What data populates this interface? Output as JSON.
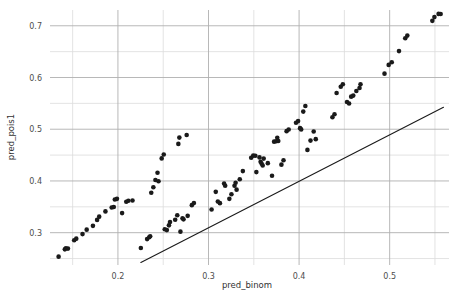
{
  "chart_data": {
    "type": "scatter",
    "title": "",
    "xlabel": "pred_binom",
    "ylabel": "pred_pois1",
    "xlim": [
      0.125,
      0.5655
    ],
    "ylim": [
      0.2375,
      0.7305
    ],
    "xticks": [
      0.2,
      0.3,
      0.4,
      0.5
    ],
    "xtick_labels": [
      "0.2",
      "0.3",
      "0.4",
      "0.5"
    ],
    "yticks": [
      0.3,
      0.4,
      0.5,
      0.6,
      0.7
    ],
    "ytick_labels": [
      "0.3",
      "0.4",
      "0.5",
      "0.6",
      "0.7"
    ],
    "x_minor_ticks": [
      0.15,
      0.25,
      0.35,
      0.45,
      0.55
    ],
    "y_minor_ticks": [
      0.25,
      0.35,
      0.45,
      0.55,
      0.65
    ],
    "grid": true,
    "grid_major_color": "#b0b0b0",
    "grid_minor_color": "#dcdcdc",
    "point_color": "#1a1a1a",
    "point_size": 2.3,
    "legend": null,
    "reference_line": {
      "label": "identity-reference-line",
      "color": "#1a1a1a",
      "width": 1.1,
      "x": [
        0.2253,
        0.5594
      ],
      "y": [
        0.2424,
        0.5423
      ]
    },
    "series": [
      {
        "name": "pred_pois1 vs pred_binom",
        "marker": "circle",
        "color": "#1a1a1a",
        "points": [
          [
            0.1345,
            0.2536
          ],
          [
            0.1414,
            0.2678
          ],
          [
            0.1425,
            0.27
          ],
          [
            0.1448,
            0.2692
          ],
          [
            0.1517,
            0.2853
          ],
          [
            0.154,
            0.2884
          ],
          [
            0.1609,
            0.2972
          ],
          [
            0.1655,
            0.3058
          ],
          [
            0.1724,
            0.3132
          ],
          [
            0.177,
            0.3247
          ],
          [
            0.1793,
            0.331
          ],
          [
            0.1862,
            0.3411
          ],
          [
            0.1931,
            0.3486
          ],
          [
            0.1954,
            0.3496
          ],
          [
            0.1966,
            0.3642
          ],
          [
            0.1989,
            0.3654
          ],
          [
            0.2046,
            0.3378
          ],
          [
            0.2092,
            0.3598
          ],
          [
            0.2115,
            0.3618
          ],
          [
            0.2161,
            0.3623
          ],
          [
            0.2253,
            0.2704
          ],
          [
            0.2322,
            0.2876
          ],
          [
            0.2345,
            0.2912
          ],
          [
            0.2356,
            0.293
          ],
          [
            0.2368,
            0.3772
          ],
          [
            0.2391,
            0.3877
          ],
          [
            0.2414,
            0.4017
          ],
          [
            0.2437,
            0.4158
          ],
          [
            0.2448,
            0.3993
          ],
          [
            0.2483,
            0.4436
          ],
          [
            0.2506,
            0.4511
          ],
          [
            0.2517,
            0.3066
          ],
          [
            0.254,
            0.305
          ],
          [
            0.2563,
            0.3142
          ],
          [
            0.2575,
            0.3205
          ],
          [
            0.2632,
            0.325
          ],
          [
            0.2655,
            0.3338
          ],
          [
            0.2667,
            0.4716
          ],
          [
            0.2678,
            0.4838
          ],
          [
            0.269,
            0.302
          ],
          [
            0.2713,
            0.328
          ],
          [
            0.2724,
            0.3258
          ],
          [
            0.2759,
            0.4887
          ],
          [
            0.277,
            0.3325
          ],
          [
            0.2816,
            0.3532
          ],
          [
            0.2839,
            0.3575
          ],
          [
            0.3034,
            0.3449
          ],
          [
            0.308,
            0.3789
          ],
          [
            0.3103,
            0.3602
          ],
          [
            0.3126,
            0.3571
          ],
          [
            0.3172,
            0.3952
          ],
          [
            0.3184,
            0.3906
          ],
          [
            0.323,
            0.3654
          ],
          [
            0.3253,
            0.3742
          ],
          [
            0.3287,
            0.3906
          ],
          [
            0.3299,
            0.3966
          ],
          [
            0.331,
            0.3832
          ],
          [
            0.3345,
            0.4033
          ],
          [
            0.3379,
            0.419
          ],
          [
            0.3471,
            0.4448
          ],
          [
            0.3494,
            0.449
          ],
          [
            0.3517,
            0.4486
          ],
          [
            0.3528,
            0.4171
          ],
          [
            0.3563,
            0.4455
          ],
          [
            0.3575,
            0.4371
          ],
          [
            0.3586,
            0.4335
          ],
          [
            0.3598,
            0.4298
          ],
          [
            0.3609,
            0.4432
          ],
          [
            0.3655,
            0.4344
          ],
          [
            0.3701,
            0.41
          ],
          [
            0.3724,
            0.476
          ],
          [
            0.3747,
            0.4768
          ],
          [
            0.3759,
            0.4836
          ],
          [
            0.377,
            0.4771
          ],
          [
            0.3805,
            0.4315
          ],
          [
            0.3828,
            0.44
          ],
          [
            0.3862,
            0.4963
          ],
          [
            0.3885,
            0.4995
          ],
          [
            0.3966,
            0.5126
          ],
          [
            0.3989,
            0.5157
          ],
          [
            0.4011,
            0.5021
          ],
          [
            0.4023,
            0.4997
          ],
          [
            0.4046,
            0.5341
          ],
          [
            0.4069,
            0.545
          ],
          [
            0.4092,
            0.46
          ],
          [
            0.4126,
            0.478
          ],
          [
            0.4161,
            0.4955
          ],
          [
            0.4184,
            0.4808
          ],
          [
            0.4368,
            0.5232
          ],
          [
            0.4391,
            0.529
          ],
          [
            0.4414,
            0.57
          ],
          [
            0.446,
            0.582
          ],
          [
            0.4483,
            0.587
          ],
          [
            0.4529,
            0.5525
          ],
          [
            0.4552,
            0.5496
          ],
          [
            0.4575,
            0.563
          ],
          [
            0.4598,
            0.565
          ],
          [
            0.4632,
            0.574
          ],
          [
            0.4667,
            0.5798
          ],
          [
            0.4678,
            0.587
          ],
          [
            0.4943,
            0.6074
          ],
          [
            0.4989,
            0.6244
          ],
          [
            0.5023,
            0.6294
          ],
          [
            0.5103,
            0.651
          ],
          [
            0.5172,
            0.676
          ],
          [
            0.5195,
            0.681
          ],
          [
            0.5471,
            0.7095
          ],
          [
            0.5494,
            0.7168
          ],
          [
            0.554,
            0.723
          ],
          [
            0.5563,
            0.7228
          ]
        ]
      }
    ]
  },
  "axes": {
    "x_axis_label": "pred_binom",
    "y_axis_label": "pred_pois1"
  }
}
